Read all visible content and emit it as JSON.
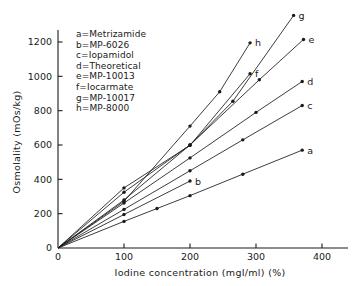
{
  "chart_data": {
    "type": "line",
    "title": "",
    "xlabel": "Iodine concentration (mgI/ml) (%)",
    "ylabel": "Osmolality (mOs/kg)",
    "xlim": [
      0,
      420
    ],
    "ylim": [
      0,
      1400
    ],
    "xticks": [
      0,
      100,
      200,
      300,
      400
    ],
    "xtick_labels": [
      "0",
      "100",
      "200",
      "300",
      "400"
    ],
    "yticks": [
      0,
      200,
      400,
      600,
      800,
      1000,
      1200
    ],
    "ytick_labels": [
      "0",
      "200",
      "400",
      "600",
      "800",
      "1000",
      "1200"
    ],
    "grid": false,
    "legend_position": "upper-left-inside",
    "legend_entries": [
      "a=Metrizamide",
      "b=MP-6026",
      "c=Iopamidol",
      "d=Theoretical",
      "e=MP-10013",
      "f=Iocarmate",
      "g=MP-10017",
      "h=MP-8000"
    ],
    "series": [
      {
        "name": "a",
        "label": "a=Metrizamide",
        "end_label": "a",
        "x": [
          0,
          100,
          150,
          200,
          280,
          370
        ],
        "y": [
          0,
          155,
          230,
          305,
          430,
          570
        ]
      },
      {
        "name": "b",
        "label": "b=MP-6026",
        "end_label": "b",
        "x": [
          0,
          100,
          200
        ],
        "y": [
          0,
          195,
          390
        ]
      },
      {
        "name": "c",
        "label": "c=Iopamidol",
        "end_label": "c",
        "x": [
          0,
          100,
          200,
          280,
          370
        ],
        "y": [
          0,
          225,
          450,
          630,
          830
        ]
      },
      {
        "name": "d",
        "label": "d=Theoretical",
        "end_label": "d",
        "x": [
          0,
          100,
          200,
          300,
          370
        ],
        "y": [
          0,
          262,
          525,
          790,
          970
        ]
      },
      {
        "name": "e",
        "label": "e=MP-10013",
        "end_label": "e",
        "x": [
          0,
          100,
          200,
          305,
          372
        ],
        "y": [
          0,
          325,
          600,
          980,
          1215
        ]
      },
      {
        "name": "f",
        "label": "f=Iocarmate",
        "end_label": "f",
        "x": [
          0,
          100,
          200,
          291
        ],
        "y": [
          0,
          350,
          598,
          1015
        ]
      },
      {
        "name": "g",
        "label": "g=MP-10017",
        "end_label": "g",
        "x": [
          0,
          100,
          200,
          265,
          357
        ],
        "y": [
          0,
          280,
          600,
          855,
          1355
        ]
      },
      {
        "name": "h",
        "label": "h=MP-8000",
        "end_label": "h",
        "x": [
          0,
          100,
          200,
          245,
          291
        ],
        "y": [
          0,
          272,
          710,
          910,
          1195
        ]
      }
    ]
  }
}
